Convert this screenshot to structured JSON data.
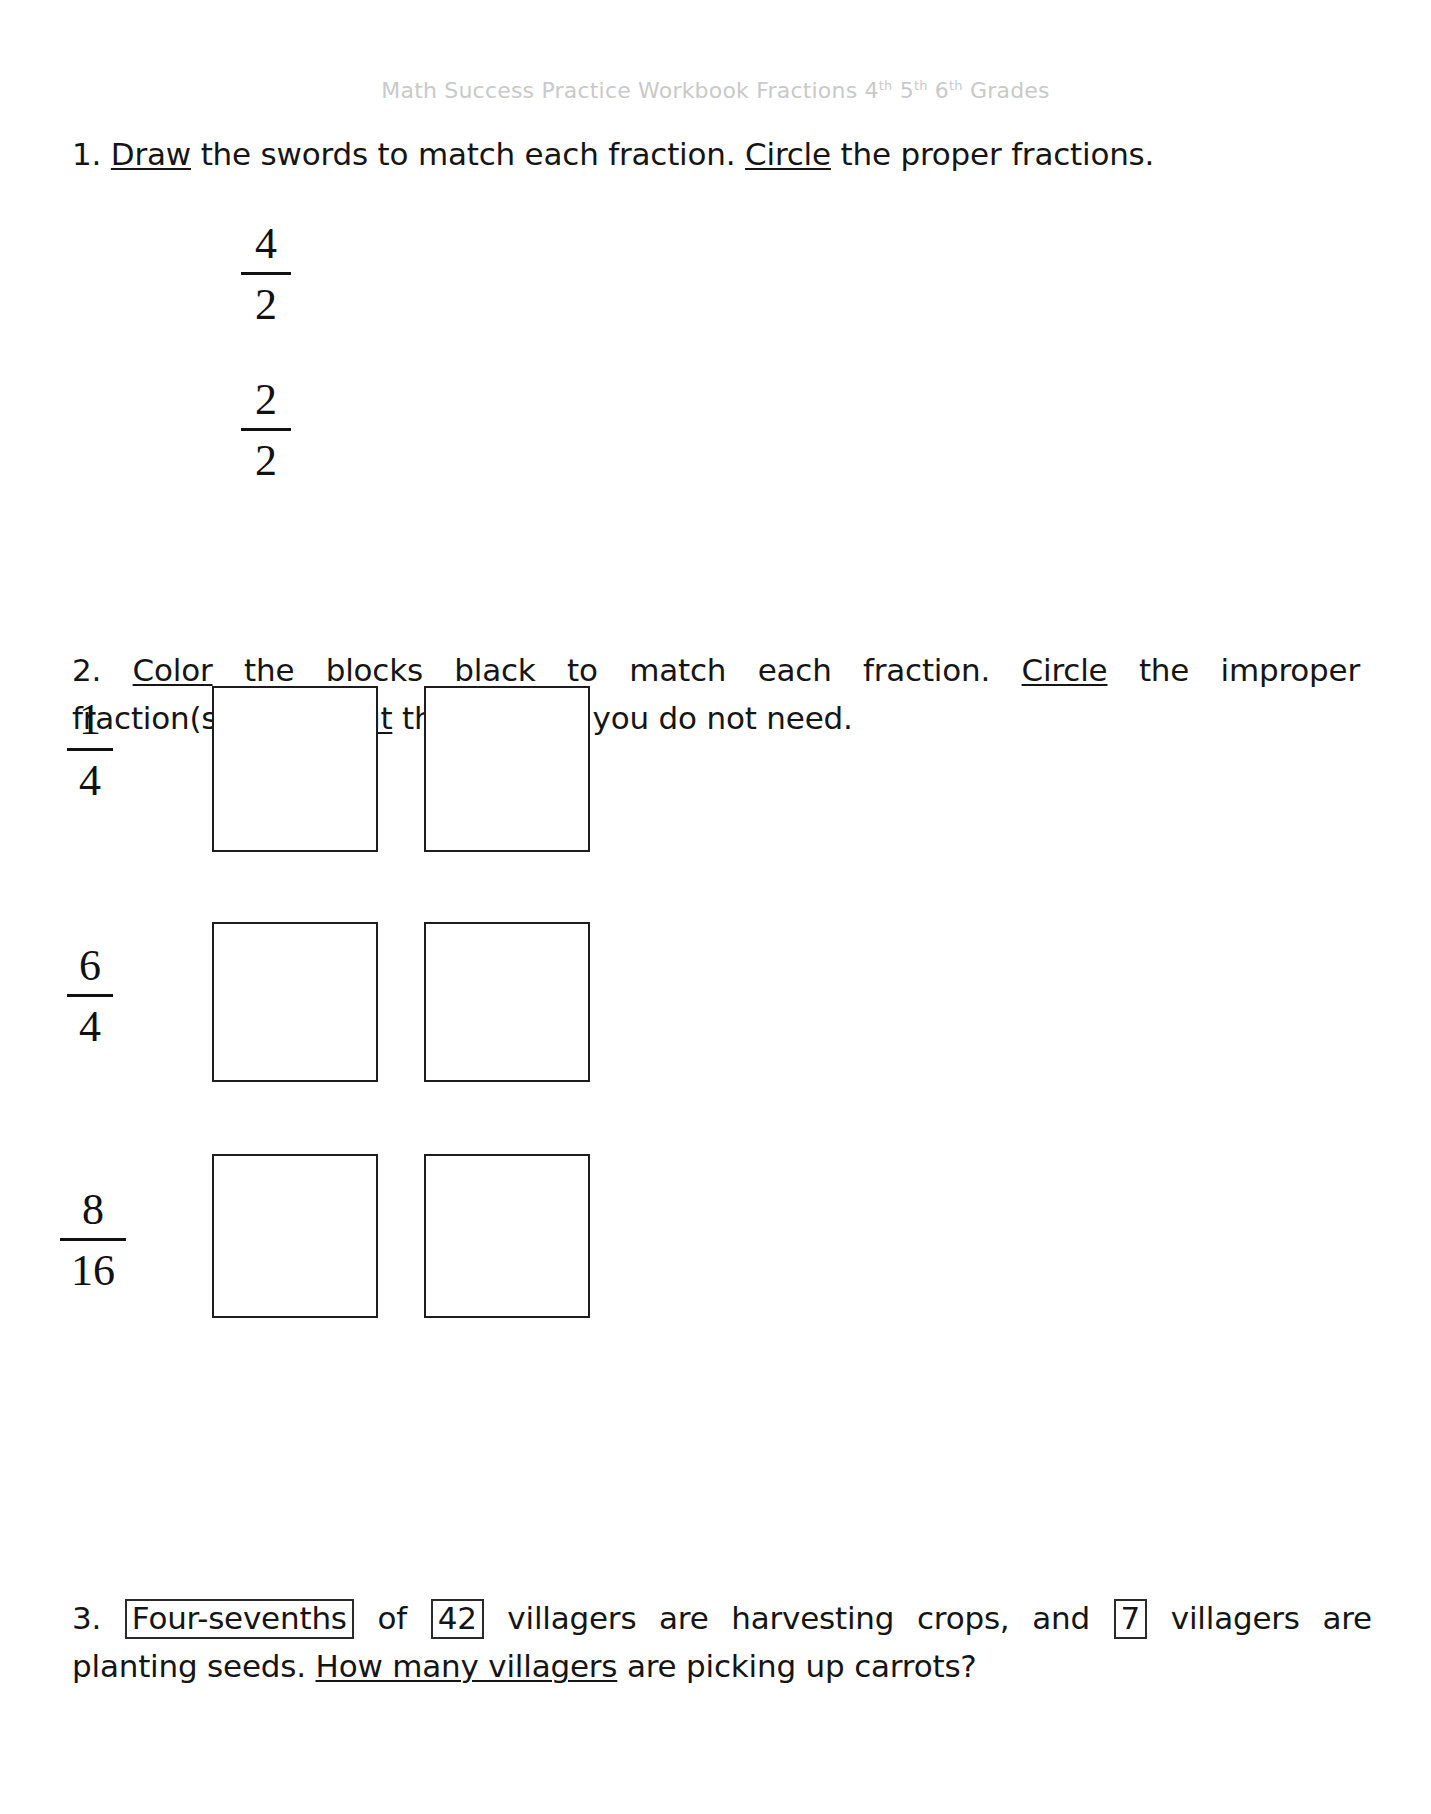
{
  "header": {
    "title_before": "Math Success Practice Workbook Fractions ",
    "grade1": "4",
    "grade1_sup": "th",
    "grade2": "5",
    "grade2_sup": "th",
    "grade3": "6",
    "grade3_sup": "th",
    "title_after": " Grades",
    "full_text": "Math Success Practice Workbook Fractions 4th 5th 6th Grades",
    "color": "#c9c9c9"
  },
  "questions": [
    {
      "number": "1.",
      "prompt_parts": {
        "p1": "1. ",
        "u1": "Draw",
        "p2": " the swords to match each fraction. ",
        "u2": "Circle",
        "p3": " the proper fractions."
      },
      "fractions": [
        {
          "numerator": "4",
          "denominator": "2"
        },
        {
          "numerator": "2",
          "denominator": "2"
        }
      ]
    },
    {
      "number": "2.",
      "prompt_parts": {
        "p1": "2. ",
        "u1": "Color",
        "p2": " the blocks black to match each fraction. ",
        "u2": "Circle",
        "p3": " the improper",
        "p4": "fraction(s). ",
        "u3": "Cross out",
        "p5": " the block(s) you do not need."
      },
      "rows": [
        {
          "numerator": "1",
          "denominator": "4",
          "blocks": 2
        },
        {
          "numerator": "6",
          "denominator": "4",
          "blocks": 2
        },
        {
          "numerator": "8",
          "denominator": "16",
          "blocks": 2
        }
      ]
    },
    {
      "number": "3.",
      "prompt_parts": {
        "p1": "3. ",
        "box1": "Four-sevenths",
        "p2": " of ",
        "box2": "42",
        "p3": " villagers are harvesting crops, and ",
        "box3": "7",
        "p4": " villagers are",
        "p5": "planting seeds. ",
        "u1": "How many villagers",
        "p6": " are picking up carrots?"
      }
    }
  ],
  "colors": {
    "ink": "#151515",
    "block_border": "#1d1d1d",
    "header_gray": "#c9c9c9",
    "paper": "#ffffff"
  }
}
